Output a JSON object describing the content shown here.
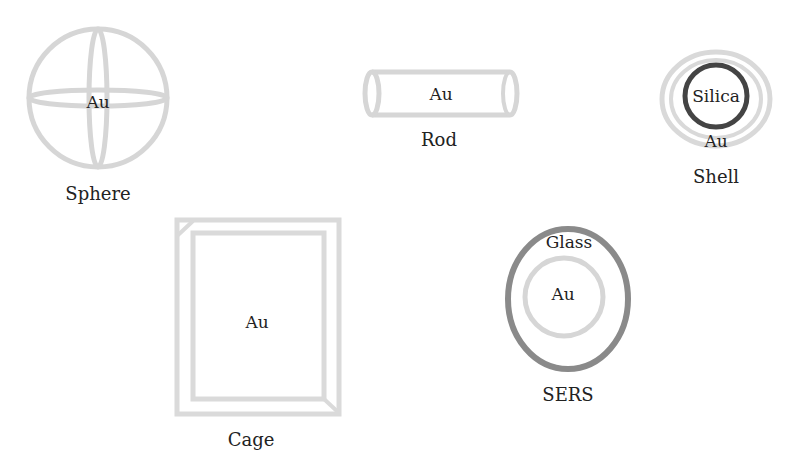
{
  "colors": {
    "gold_stroke": "#d6d6d6",
    "silica_stroke": "#444444",
    "glass_stroke": "#8a8a8a",
    "text": "#222222"
  },
  "shapes": {
    "sphere": {
      "name": "Sphere",
      "material": "Au"
    },
    "rod": {
      "name": "Rod",
      "material": "Au"
    },
    "shell": {
      "name": "Shell",
      "core": "Silica",
      "coating": "Au"
    },
    "cage": {
      "name": "Cage",
      "material": "Au"
    },
    "sers": {
      "name": "SERS",
      "core": "Au",
      "coating": "Glass"
    }
  }
}
